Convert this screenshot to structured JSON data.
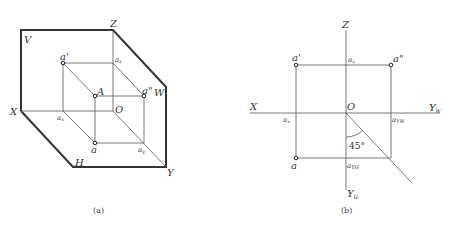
{
  "figure_a": {
    "caption": "(a)",
    "plane_labels": {
      "v": "V",
      "h": "H",
      "w": "W"
    },
    "axis_labels": {
      "x": "X",
      "y": "Y",
      "z": "Z",
      "origin": "O"
    },
    "point_labels": {
      "space_point": "A",
      "front_projection": "a'",
      "top_projection": "a",
      "side_projection": "a\"",
      "ax": "a",
      "ax_sub": "x",
      "ay": "a",
      "ay_sub": "y",
      "az": "a",
      "az_sub": "z"
    }
  },
  "figure_b": {
    "caption": "(b)",
    "axis_labels": {
      "x": "X",
      "z": "Z",
      "origin": "O",
      "yw": "Y",
      "yw_sub": "W",
      "yh": "Y",
      "yh_sub": "H"
    },
    "point_labels": {
      "front_projection": "a'",
      "top_projection": "a",
      "side_projection": "a\"",
      "ax": "a",
      "ax_sub": "x",
      "az": "a",
      "az_sub": "z",
      "ayw": "a",
      "ayw_sub": "YW",
      "ayh": "a",
      "ayh_sub": "YH"
    },
    "angle_label": "45°"
  }
}
